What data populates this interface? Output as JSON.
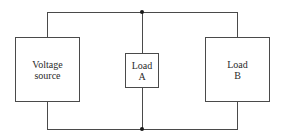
{
  "diagram": {
    "type": "parallel-circuit-block-diagram",
    "components": [
      {
        "id": "voltage-source",
        "lines": [
          "Voltage",
          "source"
        ]
      },
      {
        "id": "load-a",
        "lines": [
          "Load",
          "A"
        ]
      },
      {
        "id": "load-b",
        "lines": [
          "Load",
          "B"
        ]
      }
    ],
    "connections": [
      {
        "from": "voltage-source",
        "to": "load-a",
        "type": "parallel"
      },
      {
        "from": "load-a",
        "to": "load-b",
        "type": "parallel"
      }
    ],
    "junctions": [
      "top-rail",
      "bottom-rail"
    ],
    "colors": {
      "line": "#4a4a4a",
      "text": "#2a2a2a",
      "junction": "#1a1a1a",
      "background": "#ffffff"
    }
  }
}
